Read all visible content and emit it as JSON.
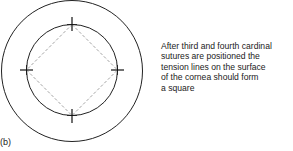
{
  "figure": {
    "panel_label": "(b)",
    "caption_lines": [
      "After third and fourth cardinal",
      "sutures are positioned the",
      "tension lines on the surface",
      "of the cornea should form",
      "a square"
    ],
    "outer_circle": {
      "cx": 72,
      "cy": 71,
      "r": 70.5
    },
    "inner_circle": {
      "cx": 72,
      "cy": 70,
      "r": 45.5
    },
    "sutures": [
      {
        "name": "top",
        "x": 72,
        "y": 24.5
      },
      {
        "name": "right",
        "x": 117.5,
        "y": 70
      },
      {
        "name": "bottom",
        "x": 72,
        "y": 115.5
      },
      {
        "name": "left",
        "x": 26.5,
        "y": 70
      }
    ],
    "colors": {
      "line": "#222222",
      "dashed": "#8a8a8a"
    }
  }
}
